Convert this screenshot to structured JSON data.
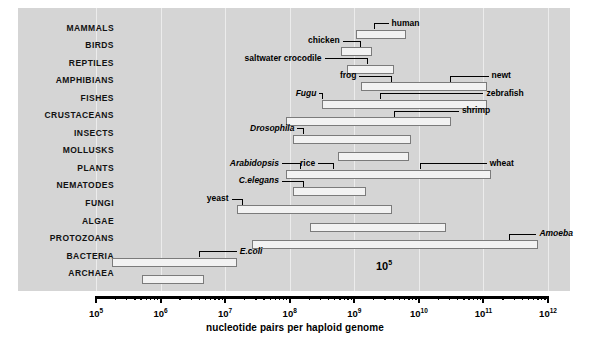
{
  "figure": {
    "axis_title": "nucleotide pairs per haploid genome",
    "stray_annotation": "10",
    "stray_annotation_exp": "5",
    "panel_color": "#d5d5d5",
    "bar_fill": "#f2f2f2",
    "bar_stroke": "#7b7b7b"
  },
  "axis": {
    "min_exp": 5,
    "max_exp": 12,
    "ticks": [
      {
        "mantissa": "10",
        "exp": "5"
      },
      {
        "mantissa": "10",
        "exp": "6"
      },
      {
        "mantissa": "10",
        "exp": "7"
      },
      {
        "mantissa": "10",
        "exp": "8"
      },
      {
        "mantissa": "10",
        "exp": "9"
      },
      {
        "mantissa": "10",
        "exp": "10"
      },
      {
        "mantissa": "10",
        "exp": "11"
      },
      {
        "mantissa": "10",
        "exp": "12"
      }
    ]
  },
  "chart_data": {
    "type": "bar",
    "title": "",
    "xlabel": "nucleotide pairs per haploid genome",
    "ylabel": "",
    "xscale": "log10",
    "xlim": [
      100000,
      1000000000000
    ],
    "grid": true,
    "orientation": "horizontal-range",
    "categories": [
      "MAMMALS",
      "BIRDS",
      "REPTILES",
      "AMPHIBIANS",
      "FISHES",
      "CRUSTACEANS",
      "INSECTS",
      "MOLLUSKS",
      "PLANTS",
      "NEMATODES",
      "FUNGI",
      "ALGAE",
      "PROTOZOANS",
      "BACTERIA",
      "ARCHAEA"
    ],
    "rows": [
      {
        "category": "MAMMALS",
        "start_exp": 9.02,
        "end_exp": 9.8,
        "markers": [
          {
            "name": "human",
            "value_exp": 9.49,
            "label_side": "right",
            "style": "bold",
            "leader_from_exp": 9.3,
            "leader_to_exp": 9.53
          }
        ]
      },
      {
        "category": "BIRDS",
        "start_exp": 8.8,
        "end_exp": 9.28,
        "markers": [
          {
            "name": "chicken",
            "value_exp": 9.1,
            "label_side": "left",
            "style": "bold",
            "leader_from_exp": 8.82,
            "leader_to_exp": 9.1
          }
        ]
      },
      {
        "category": "REPTILES",
        "start_exp": 8.88,
        "end_exp": 9.62,
        "markers": [
          {
            "name": "saltwater crocodile",
            "value_exp": 9.22,
            "label_side": "left",
            "style": "bold",
            "leader_from_exp": 8.54,
            "leader_to_exp": 9.22
          }
        ]
      },
      {
        "category": "AMPHIBIANS",
        "start_exp": 9.1,
        "end_exp": 11.05,
        "markers": [
          {
            "name": "frog",
            "value_exp": 9.58,
            "label_side": "left",
            "style": "bold",
            "leader_from_exp": 9.08,
            "leader_to_exp": 9.58
          },
          {
            "name": "newt",
            "value_exp": 10.48,
            "label_side": "right",
            "style": "bold",
            "leader_from_exp": 10.48,
            "leader_to_exp": 11.08
          }
        ]
      },
      {
        "category": "FISHES",
        "start_exp": 8.5,
        "end_exp": 11.05,
        "markers": [
          {
            "name": "Fugu",
            "value_exp": 8.52,
            "label_side": "left",
            "style": "italic",
            "leader_from_exp": 8.46,
            "leader_to_exp": 8.52
          },
          {
            "name": "zebrafish",
            "value_exp": 9.4,
            "label_side": "right",
            "style": "bold",
            "leader_from_exp": 9.4,
            "leader_to_exp": 11.0
          }
        ]
      },
      {
        "category": "CRUSTACEANS",
        "start_exp": 7.95,
        "end_exp": 10.5,
        "markers": [
          {
            "name": "shrimp",
            "value_exp": 9.62,
            "label_side": "right",
            "style": "bold",
            "leader_from_exp": 9.62,
            "leader_to_exp": 10.62
          }
        ]
      },
      {
        "category": "INSECTS",
        "start_exp": 8.05,
        "end_exp": 9.88,
        "markers": [
          {
            "name": "Drosophila",
            "value_exp": 8.22,
            "label_side": "left",
            "style": "italic",
            "leader_from_exp": 8.12,
            "leader_to_exp": 8.22
          }
        ]
      },
      {
        "category": "MOLLUSKS",
        "start_exp": 8.75,
        "end_exp": 9.85,
        "markers": []
      },
      {
        "category": "PLANTS",
        "start_exp": 7.95,
        "end_exp": 11.12,
        "markers": [
          {
            "name": "Arabidopsis",
            "value_exp": 8.18,
            "label_side": "left",
            "style": "italic",
            "leader_from_exp": 7.88,
            "leader_to_exp": 8.18
          },
          {
            "name": "rice",
            "value_exp": 8.68,
            "label_side": "left",
            "style": "bold",
            "leader_from_exp": 8.44,
            "leader_to_exp": 8.68
          },
          {
            "name": "wheat",
            "value_exp": 10.02,
            "label_side": "right",
            "style": "bold",
            "leader_from_exp": 10.02,
            "leader_to_exp": 11.05
          }
        ]
      },
      {
        "category": "NEMATODES",
        "start_exp": 8.05,
        "end_exp": 9.18,
        "markers": [
          {
            "name": "C.elegans",
            "value_exp": 8.22,
            "label_side": "left",
            "style": "italic",
            "leader_from_exp": 7.88,
            "leader_to_exp": 8.22
          }
        ]
      },
      {
        "category": "FUNGI",
        "start_exp": 7.18,
        "end_exp": 9.58,
        "markers": [
          {
            "name": "yeast",
            "value_exp": 7.28,
            "label_side": "left",
            "style": "bold",
            "leader_from_exp": 7.1,
            "leader_to_exp": 7.28
          }
        ]
      },
      {
        "category": "ALGAE",
        "start_exp": 8.32,
        "end_exp": 10.42,
        "markers": []
      },
      {
        "category": "PROTOZOANS",
        "start_exp": 7.42,
        "end_exp": 11.84,
        "markers": [
          {
            "name": "Amoeba",
            "value_exp": 11.4,
            "label_side": "right",
            "style": "italic",
            "leader_from_exp": 11.4,
            "leader_to_exp": 11.82
          }
        ]
      },
      {
        "category": "BACTERIA",
        "start_exp": 5.25,
        "end_exp": 7.18,
        "markers": [
          {
            "name": "E.coli",
            "value_exp": 6.6,
            "label_side": "right",
            "style": "italic",
            "leader_from_exp": 6.6,
            "leader_to_exp": 7.18
          }
        ]
      },
      {
        "category": "ARCHAEA",
        "start_exp": 5.72,
        "end_exp": 6.68,
        "markers": []
      }
    ]
  }
}
